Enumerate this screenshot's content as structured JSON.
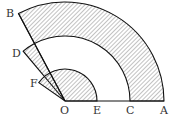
{
  "diagram": {
    "type": "geometry-sectors",
    "center": "O",
    "points": {
      "O": {
        "label": "O"
      },
      "E": {
        "label": "E"
      },
      "C": {
        "label": "C"
      },
      "A": {
        "label": "A"
      },
      "B": {
        "label": "B"
      },
      "D": {
        "label": "D"
      },
      "F": {
        "label": "F"
      }
    },
    "shaded_regions": [
      "annular sector between arc AB and arc CD",
      "wedge between OB and OD",
      "sector OEF"
    ],
    "colors": {
      "stroke": "#111111",
      "hatch": "#555555",
      "text": "#333333"
    }
  }
}
